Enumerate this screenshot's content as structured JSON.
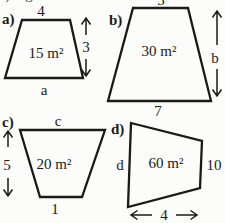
{
  "colors": {
    "background": "#fcfcfb",
    "ink": "#1a1a1a"
  },
  "figure": {
    "type": "trapezoid-area-exercises",
    "panels": {
      "a": {
        "label": "a)",
        "top": "4",
        "side": "3",
        "bottom": "a",
        "area": "15 m²"
      },
      "b": {
        "label": "b)",
        "top": "5",
        "side": "b",
        "bottom": "7",
        "area": "30 m²"
      },
      "c": {
        "label": "c)",
        "top": "c",
        "side": "5",
        "bottom": "1",
        "area": "20 m²"
      },
      "d": {
        "label": "d)",
        "left": "d",
        "right": "10",
        "bottom": "4",
        "area": "60 m²"
      }
    },
    "cropped_edge_remnants": {
      "left_glyph": ")",
      "g_glyph": "g"
    }
  }
}
